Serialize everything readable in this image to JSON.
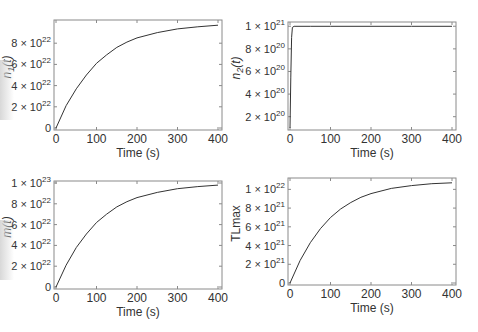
{
  "chart_data": [
    {
      "type": "line",
      "panel": "top-left",
      "title": "",
      "xlabel": "Time (s)",
      "ylabel": "n1(t)",
      "xlim": [
        0,
        400
      ],
      "ylim": [
        0,
        1e+23
      ],
      "xticks": [
        0,
        100,
        200,
        300,
        400
      ],
      "xtick_labels": [
        "0",
        "100",
        "200",
        "300",
        "400"
      ],
      "yticks": [
        0,
        2e+22,
        4e+22,
        6e+22,
        8e+22
      ],
      "ytick_labels": [
        {
          "mant": "0",
          "exp": ""
        },
        {
          "mant": "2 × 10",
          "exp": "22"
        },
        {
          "mant": "4 × 10",
          "exp": "22"
        },
        {
          "mant": "6 × 10",
          "exp": "22"
        },
        {
          "mant": "8 × 10",
          "exp": "22"
        }
      ],
      "grid": false,
      "x": [
        0,
        25,
        50,
        75,
        100,
        125,
        150,
        175,
        200,
        250,
        300,
        350,
        400
      ],
      "values": [
        0,
        2.1e+22,
        3.7e+22,
        5e+22,
        6.1e+22,
        6.9e+22,
        7.6e+22,
        8.1e+22,
        8.5e+22,
        9e+22,
        9.35e+22,
        9.55e+22,
        9.7e+22
      ]
    },
    {
      "type": "line",
      "panel": "top-right",
      "title": "",
      "xlabel": "Time (s)",
      "ylabel": "n2(t)",
      "xlim": [
        0,
        400
      ],
      "ylim": [
        1e+20,
        1.02e+21
      ],
      "xticks": [
        0,
        100,
        200,
        300,
        400
      ],
      "xtick_labels": [
        "0",
        "100",
        "200",
        "300",
        "400"
      ],
      "yticks": [
        2e+20,
        4e+20,
        6e+20,
        8e+20,
        1e+21
      ],
      "ytick_labels": [
        {
          "mant": "2 × 10",
          "exp": "20"
        },
        {
          "mant": "4 × 10",
          "exp": "20"
        },
        {
          "mant": "6 × 10",
          "exp": "20"
        },
        {
          "mant": "8 × 10",
          "exp": "20"
        },
        {
          "mant": "1 × 10",
          "exp": "21"
        }
      ],
      "grid": false,
      "x": [
        0,
        2,
        4,
        6,
        10,
        50,
        100,
        200,
        300,
        400
      ],
      "values": [
        1e+20,
        5.5e+20,
        9e+20,
        9.9e+20,
        1e+21,
        1e+21,
        1e+21,
        1e+21,
        1e+21,
        1e+21
      ]
    },
    {
      "type": "line",
      "panel": "bottom-left",
      "title": "",
      "xlabel": "Time (s)",
      "ylabel": "m(t)",
      "xlim": [
        0,
        400
      ],
      "ylim": [
        0,
        1e+23
      ],
      "xticks": [
        0,
        100,
        200,
        300,
        400
      ],
      "xtick_labels": [
        "0",
        "100",
        "200",
        "300",
        "400"
      ],
      "yticks": [
        0,
        2e+22,
        4e+22,
        6e+22,
        8e+22,
        1e+23
      ],
      "ytick_labels": [
        {
          "mant": "0",
          "exp": ""
        },
        {
          "mant": "2 × 10",
          "exp": "22"
        },
        {
          "mant": "4 × 10",
          "exp": "22"
        },
        {
          "mant": "6 × 10",
          "exp": "22"
        },
        {
          "mant": "8 × 10",
          "exp": "22"
        },
        {
          "mant": "1 × 10",
          "exp": "23"
        }
      ],
      "grid": false,
      "x": [
        0,
        25,
        50,
        75,
        100,
        125,
        150,
        175,
        200,
        250,
        300,
        350,
        400
      ],
      "values": [
        0,
        2.1e+22,
        3.8e+22,
        5.1e+22,
        6.2e+22,
        7e+22,
        7.7e+22,
        8.2e+22,
        8.6e+22,
        9.1e+22,
        9.45e+22,
        9.65e+22,
        9.8e+22
      ]
    },
    {
      "type": "line",
      "panel": "bottom-right",
      "title": "",
      "xlabel": "Time (s)",
      "ylabel": "TLmax",
      "xlim": [
        0,
        400
      ],
      "ylim": [
        0,
        1.1e+22
      ],
      "xticks": [
        0,
        100,
        200,
        300,
        400
      ],
      "xtick_labels": [
        "0",
        "100",
        "200",
        "300",
        "400"
      ],
      "yticks": [
        0,
        2e+21,
        4e+21,
        6e+21,
        8e+21,
        1e+22
      ],
      "ytick_labels": [
        {
          "mant": "0",
          "exp": ""
        },
        {
          "mant": "2 × 10",
          "exp": "21"
        },
        {
          "mant": "4 × 10",
          "exp": "21"
        },
        {
          "mant": "6 × 10",
          "exp": "21"
        },
        {
          "mant": "8 × 10",
          "exp": "21"
        },
        {
          "mant": "1 × 10",
          "exp": "22"
        }
      ],
      "grid": false,
      "x": [
        0,
        25,
        50,
        75,
        100,
        125,
        150,
        175,
        200,
        250,
        300,
        350,
        400
      ],
      "values": [
        0,
        2.4e+21,
        4.3e+21,
        5.8e+21,
        7e+21,
        7.9e+21,
        8.6e+21,
        9.15e+21,
        9.55e+21,
        1.01e+22,
        1.04e+22,
        1.06e+22,
        1.07e+22
      ]
    }
  ],
  "layout": {
    "panels": [
      {
        "left": 54,
        "top": 20,
        "width": 168,
        "height": 110
      },
      {
        "left": 288,
        "top": 22,
        "width": 168,
        "height": 108
      },
      {
        "left": 54,
        "top": 181,
        "width": 168,
        "height": 108
      },
      {
        "left": 288,
        "top": 178,
        "width": 168,
        "height": 107
      }
    ],
    "line_color": "#333333",
    "frame_color": "#8a8a8a"
  }
}
